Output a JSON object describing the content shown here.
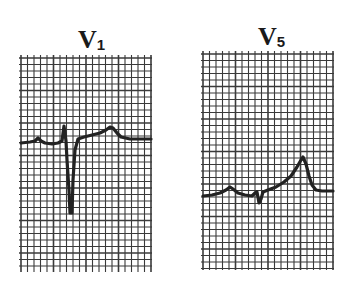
{
  "figure": {
    "type": "ECG lead strips",
    "background": "#ffffff",
    "grid_color": "#3a3a3a",
    "trace_color": "#222222",
    "grid_minor_spacing_px": 6.5,
    "grid_major_every": 5
  },
  "leads": [
    {
      "id": "v1",
      "letter": "V",
      "subscript": "1",
      "strip": {
        "x": 21,
        "y": 58,
        "width": 131,
        "height": 214
      },
      "baseline_y": 143,
      "description": "Small P wave, small r, deep narrow QS/S wave, ST segment rising into broad upright T wave",
      "trace_points": [
        [
          21,
          143
        ],
        [
          30,
          142
        ],
        [
          35,
          141
        ],
        [
          38,
          138
        ],
        [
          41,
          141
        ],
        [
          45,
          143
        ],
        [
          52,
          144
        ],
        [
          58,
          143
        ],
        [
          62,
          141
        ],
        [
          64,
          126
        ],
        [
          66,
          141
        ],
        [
          67,
          160
        ],
        [
          69,
          190
        ],
        [
          70,
          213
        ],
        [
          72,
          213
        ],
        [
          73,
          180
        ],
        [
          75,
          150
        ],
        [
          78,
          139
        ],
        [
          84,
          137
        ],
        [
          92,
          135
        ],
        [
          100,
          133
        ],
        [
          106,
          130
        ],
        [
          110,
          127
        ],
        [
          113,
          128
        ],
        [
          117,
          133
        ],
        [
          121,
          137
        ],
        [
          130,
          139
        ],
        [
          140,
          139
        ],
        [
          151,
          139
        ]
      ]
    },
    {
      "id": "v5",
      "letter": "V",
      "subscript": "5",
      "strip": {
        "x": 203,
        "y": 54,
        "width": 131,
        "height": 216
      },
      "baseline_y": 195,
      "description": "Small P wave, tiny r with small S, upsloping ST segment into tall peaked T wave, return to baseline",
      "trace_points": [
        [
          203,
          196
        ],
        [
          212,
          195
        ],
        [
          220,
          193
        ],
        [
          226,
          190
        ],
        [
          230,
          187
        ],
        [
          233,
          189
        ],
        [
          238,
          193
        ],
        [
          245,
          195
        ],
        [
          252,
          196
        ],
        [
          255,
          193
        ],
        [
          257,
          192
        ],
        [
          259,
          203
        ],
        [
          261,
          199
        ],
        [
          263,
          192
        ],
        [
          268,
          190
        ],
        [
          276,
          187
        ],
        [
          284,
          182
        ],
        [
          291,
          176
        ],
        [
          297,
          167
        ],
        [
          301,
          160
        ],
        [
          303,
          157
        ],
        [
          306,
          164
        ],
        [
          309,
          176
        ],
        [
          312,
          185
        ],
        [
          316,
          190
        ],
        [
          322,
          191
        ],
        [
          333,
          191
        ]
      ]
    }
  ]
}
